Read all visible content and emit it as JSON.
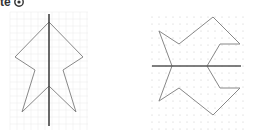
{
  "heading": {
    "text": "te",
    "icon": "circled-number-icon"
  },
  "figures": [
    {
      "name": "vertical-symmetry-figure",
      "grid": {
        "type": "lines",
        "x0": 10,
        "y0": 12,
        "x1": 88,
        "y1": 130,
        "step": 7,
        "color": "#eeeeee"
      },
      "mirror_line": {
        "x1": 49,
        "y1": 14,
        "x2": 49,
        "y2": 126,
        "color": "#444444"
      },
      "shape_points": [
        [
          49,
          22
        ],
        [
          83,
          57
        ],
        [
          63,
          70
        ],
        [
          76,
          112
        ],
        [
          49,
          86
        ],
        [
          22,
          112
        ],
        [
          35,
          70
        ],
        [
          15,
          57
        ]
      ],
      "shape_color": "#888888"
    },
    {
      "name": "horizontal-symmetry-figure",
      "grid": {
        "type": "dots",
        "x0": 152,
        "y0": 17,
        "x1": 243,
        "y1": 129,
        "step": 7,
        "color": "#c8c8c8"
      },
      "mirror_line": {
        "x1": 152,
        "y1": 66,
        "x2": 241,
        "y2": 66,
        "color": "#555555"
      },
      "shape_points": [
        [
          172,
          66
        ],
        [
          159,
          31
        ],
        [
          179,
          44
        ],
        [
          213,
          17
        ],
        [
          240,
          44
        ],
        [
          220,
          44
        ],
        [
          207,
          66
        ],
        [
          220,
          88
        ],
        [
          240,
          88
        ],
        [
          213,
          115
        ],
        [
          179,
          88
        ],
        [
          159,
          101
        ]
      ],
      "shape_color": "#888888"
    }
  ]
}
